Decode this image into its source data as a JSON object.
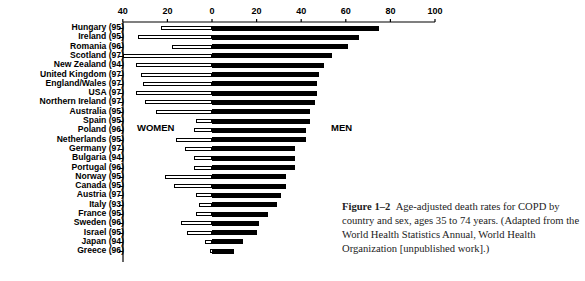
{
  "chart_data": {
    "type": "bar",
    "orientation": "horizontal-diverging",
    "title": "",
    "xlabel": "",
    "ylabel": "",
    "x_ticks": [
      40,
      20,
      0,
      20,
      40,
      60,
      80,
      100
    ],
    "xlim_women": [
      0,
      40
    ],
    "xlim_men": [
      0,
      100
    ],
    "grid": false,
    "legend": [],
    "annotations": [
      "WOMEN",
      "MEN"
    ],
    "categories": [
      "Hungary (95)",
      "Ireland (95)",
      "Romania (96)",
      "Scotland (97)",
      "New Zealand (94)",
      "United Kingdom (97)",
      "England/Wales (97)",
      "USA (97)",
      "Northern Ireland (97)",
      "Australia (95)",
      "Spain (95)",
      "Poland (96)",
      "Netherlands (95)",
      "Germany (97)",
      "Bulgaria (94)",
      "Portugal (96)",
      "Norway (95)",
      "Canada (95)",
      "Austria (97)",
      "Italy (93)",
      "France (95)",
      "Sweden (96)",
      "Israel (95)",
      "Japan (94)",
      "Greece (96)"
    ],
    "series": [
      {
        "name": "WOMEN",
        "values": [
          23,
          33,
          18,
          40,
          34,
          32,
          31,
          34,
          30,
          25,
          7,
          8,
          16,
          12,
          8,
          8,
          21,
          17,
          7,
          6,
          7,
          14,
          11,
          3,
          1
        ]
      },
      {
        "name": "MEN",
        "values": [
          75,
          66,
          61,
          54,
          50,
          48,
          47,
          47,
          46,
          44,
          44,
          42,
          42,
          37,
          37,
          37,
          33,
          33,
          31,
          29,
          25,
          21,
          20,
          14,
          10
        ]
      }
    ]
  },
  "labels": {
    "women": "WOMEN",
    "men": "MEN"
  },
  "caption": {
    "figure_label": "Figure 1–2",
    "text": "Age-adjusted death rates for COPD by country and sex, ages 35 to 74 years. (Adapted from the World Health Statistics Annual, World Health Organization [unpublished work].)"
  }
}
